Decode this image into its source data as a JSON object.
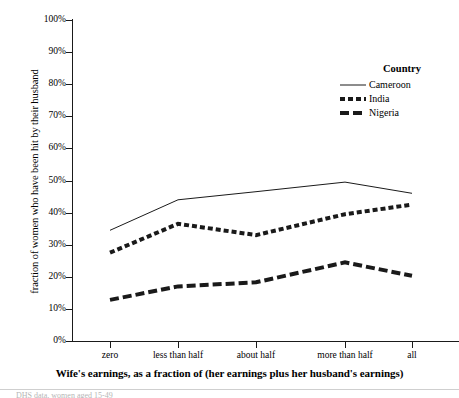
{
  "chart_data": {
    "type": "line",
    "title": "",
    "xlabel": "Wife's earnings, as a fraction of (her earnings plus her husband's earnings)",
    "ylabel": "fraction of women who have been hit by their husband",
    "categories": [
      "zero",
      "less than half",
      "about half",
      "more than half",
      "all"
    ],
    "ylim": [
      0,
      100
    ],
    "ytick_labels": [
      "0%",
      "10%",
      "20%",
      "30%",
      "40%",
      "50%",
      "60%",
      "70%",
      "80%",
      "90%",
      "100%"
    ],
    "ytick_values": [
      0,
      10,
      20,
      30,
      40,
      50,
      60,
      70,
      80,
      90,
      100
    ],
    "grid": false,
    "legend_position": "upper-right-inside",
    "legend_title": "Country",
    "series": [
      {
        "name": "Cameroon",
        "values": [
          34.5,
          44.0,
          46.5,
          49.5,
          46.0
        ],
        "line_style": "solid",
        "line_width": 1,
        "color": "#1a1a1a"
      },
      {
        "name": "India",
        "values": [
          27.5,
          36.5,
          33.0,
          39.5,
          42.5
        ],
        "line_style": "dashed-short",
        "line_width": 4,
        "color": "#1a1a1a"
      },
      {
        "name": "Nigeria",
        "values": [
          12.8,
          17.0,
          18.3,
          24.5,
          20.3
        ],
        "line_style": "dashed-long",
        "line_width": 4,
        "color": "#1a1a1a"
      }
    ]
  },
  "footer": {
    "cut_off_text": "DHS data, women aged 15-49"
  }
}
